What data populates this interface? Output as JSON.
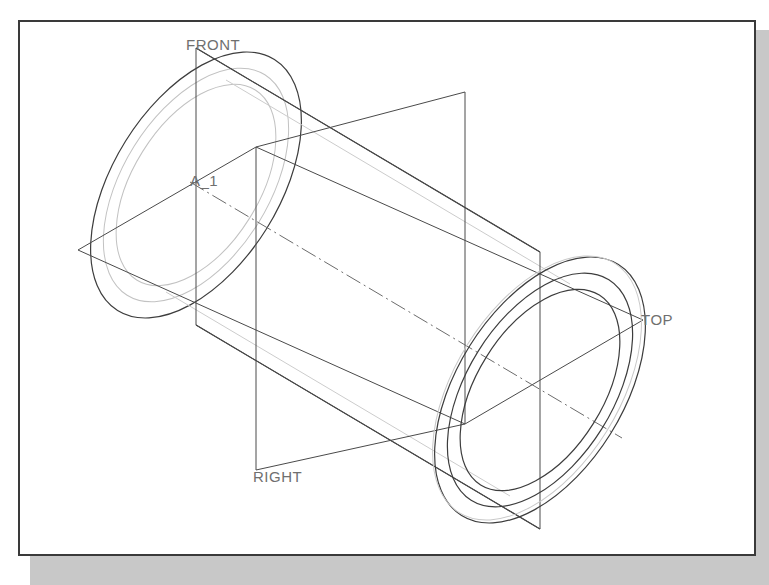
{
  "drawing": {
    "title": "Isometric CAD cylinder with datum planes",
    "background_color": "#ffffff",
    "frame_color": "#3a3a3a",
    "shadow_color": "#c8c8c8",
    "solid_line_color": "#333333",
    "hidden_line_color": "#b9b9b9",
    "center_line_color": "#707070",
    "label_color": "#6f6f6f"
  },
  "labels": [
    {
      "id": "front",
      "text": "FRONT",
      "x": 186,
      "y": 50
    },
    {
      "id": "axis",
      "text": "A_1",
      "x": 190,
      "y": 186
    },
    {
      "id": "top",
      "text": "TOP",
      "x": 641,
      "y": 325
    },
    {
      "id": "right",
      "text": "RIGHT",
      "x": 253,
      "y": 482
    }
  ],
  "geometry": {
    "cylinder": {
      "axis_start": {
        "x": 196,
        "y": 185
      },
      "axis_end": {
        "x": 540,
        "y": 390
      },
      "near_face_center": {
        "x": 540,
        "y": 390
      },
      "far_face_center": {
        "x": 196,
        "y": 185
      },
      "outer_radius_px": 148,
      "wall_radius_px": 130,
      "bore_radius_px": 112,
      "ellipse_rotation_deg": -58,
      "ellipse_ratio": 0.56
    },
    "datum_planes": [
      {
        "name": "FRONT",
        "orientation": "vertical-left-leaning",
        "corners": [
          {
            "x": 196,
            "y": 48
          },
          {
            "x": 540,
            "y": 252
          },
          {
            "x": 540,
            "y": 529
          },
          {
            "x": 196,
            "y": 325
          }
        ]
      },
      {
        "name": "TOP",
        "orientation": "horizontal",
        "corners": [
          {
            "x": 78,
            "y": 250
          },
          {
            "x": 256,
            "y": 147
          },
          {
            "x": 643,
            "y": 320
          },
          {
            "x": 465,
            "y": 424
          }
        ]
      },
      {
        "name": "RIGHT",
        "orientation": "vertical-right-leaning",
        "corners": [
          {
            "x": 256,
            "y": 147
          },
          {
            "x": 465,
            "y": 92
          },
          {
            "x": 465,
            "y": 424
          },
          {
            "x": 256,
            "y": 470
          }
        ]
      }
    ],
    "center_axis": {
      "style": "dash-dot",
      "from": {
        "x": 196,
        "y": 185
      },
      "to": {
        "x": 618,
        "y": 435
      }
    }
  }
}
